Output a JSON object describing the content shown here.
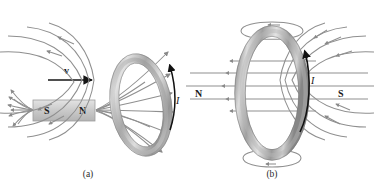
{
  "figure": {
    "background": "#ffffff",
    "field_line_color": "#8a8a8a",
    "ring_color_light": "#d8d8d8",
    "ring_color_mid": "#a9a9a9",
    "ring_color_dark": "#6e6e6e",
    "magnet_fill": "#cfcfcf",
    "current_arrow_color": "#111111"
  },
  "panel_a": {
    "caption": "(a)",
    "velocity_label": "v",
    "current_label": "I",
    "magnet": {
      "south_label": "S",
      "north_label": "N"
    },
    "description_icons": {
      "velocity_arrow": "arrow-right-icon",
      "current_arrow": "arc-arrow-up-icon",
      "field_lines": "field-lines-icon",
      "ring": "conducting-ring-icon",
      "magnet": "bar-magnet-icon"
    }
  },
  "panel_b": {
    "caption": "(b)",
    "current_label": "I",
    "north_label": "N",
    "south_label": "S",
    "description_icons": {
      "current_arrow": "arc-arrow-up-icon",
      "field_lines": "dipole-field-lines-icon",
      "ring": "conducting-ring-icon"
    }
  }
}
